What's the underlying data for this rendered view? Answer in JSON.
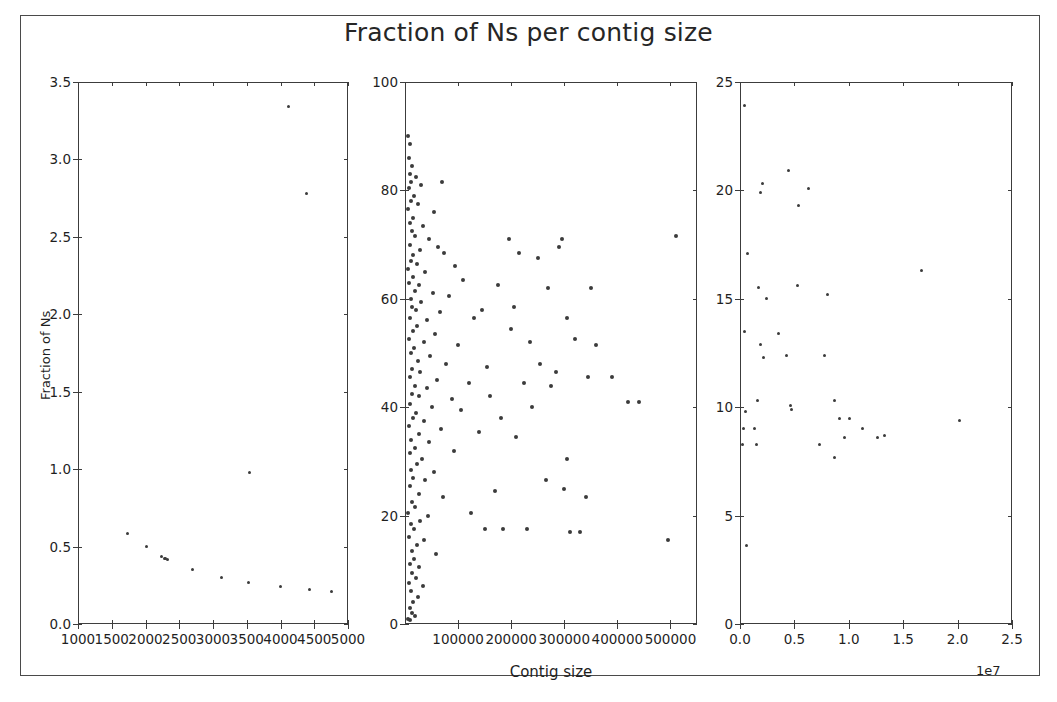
{
  "figure": {
    "title": "Fraction of Ns per contig size",
    "border_color": "#4a4a4a",
    "marker_color": "#3b3b3b",
    "background": "#ffffff",
    "width": 1057,
    "height": 702
  },
  "chart_data": [
    {
      "type": "scatter",
      "panel": "left",
      "title": "Fraction of Ns per contig size",
      "xlabel": "",
      "ylabel": "Fraction of Ns",
      "xlim": [
        1000,
        5000
      ],
      "ylim": [
        0.0,
        3.5
      ],
      "xticks": [
        1000,
        1500,
        2000,
        2500,
        3000,
        3500,
        4000,
        4500,
        5000
      ],
      "xticklabels": [
        "1000",
        "1500",
        "2000",
        "2500",
        "3000",
        "3500",
        "4000",
        "4500",
        "5000"
      ],
      "yticks": [
        0.0,
        0.5,
        1.0,
        1.5,
        2.0,
        2.5,
        3.0,
        3.5
      ],
      "yticklabels": [
        "0.0",
        "0.5",
        "1.0",
        "1.5",
        "2.0",
        "2.5",
        "3.0",
        "3.5"
      ],
      "grid": false,
      "legend": null,
      "points": [
        [
          4120,
          3.34
        ],
        [
          4380,
          2.78
        ],
        [
          3540,
          0.98
        ],
        [
          1730,
          0.585
        ],
        [
          2010,
          0.5
        ],
        [
          2230,
          0.435
        ],
        [
          2280,
          0.425
        ],
        [
          2300,
          0.42
        ],
        [
          2330,
          0.415
        ],
        [
          2700,
          0.355
        ],
        [
          3120,
          0.3
        ],
        [
          3530,
          0.265
        ],
        [
          4000,
          0.245
        ],
        [
          4430,
          0.225
        ],
        [
          4760,
          0.21
        ]
      ],
      "zero_band": {
        "description": "dense saturated band of points at Fraction of Ns = 0.0",
        "y": 0.0,
        "x_ranges": [
          [
            1000,
            3880
          ],
          [
            3960,
            4460
          ],
          [
            4540,
            4780
          ]
        ]
      }
    },
    {
      "type": "scatter",
      "panel": "middle",
      "title": "",
      "xlabel": "Contig size",
      "ylabel": "",
      "xlim": [
        0,
        550000
      ],
      "ylim": [
        0,
        100
      ],
      "xticks": [
        100000,
        200000,
        300000,
        400000,
        500000
      ],
      "xticklabels": [
        "100000",
        "200000",
        "300000",
        "400000",
        "500000"
      ],
      "yticks": [
        0,
        20,
        40,
        60,
        80,
        100
      ],
      "yticklabels": [
        "0",
        "20",
        "40",
        "60",
        "80",
        "100"
      ],
      "grid": false,
      "legend": null,
      "points": [
        [
          6000,
          90.0
        ],
        [
          9000,
          88.5
        ],
        [
          7000,
          86.0
        ],
        [
          14000,
          84.5
        ],
        [
          10000,
          83.0
        ],
        [
          21000,
          82.5
        ],
        [
          12000,
          81.5
        ],
        [
          8000,
          80.5
        ],
        [
          30000,
          81.0
        ],
        [
          70000,
          81.5
        ],
        [
          17000,
          79.0
        ],
        [
          11000,
          78.0
        ],
        [
          25000,
          77.5
        ],
        [
          5000,
          76.5
        ],
        [
          55000,
          76.0
        ],
        [
          15000,
          75.0
        ],
        [
          9500,
          74.0
        ],
        [
          33000,
          73.5
        ],
        [
          13000,
          72.5
        ],
        [
          19000,
          71.5
        ],
        [
          45000,
          71.0
        ],
        [
          8500,
          70.0
        ],
        [
          62000,
          69.5
        ],
        [
          28000,
          69.0
        ],
        [
          16000,
          68.0
        ],
        [
          74000,
          68.5
        ],
        [
          11500,
          67.0
        ],
        [
          22000,
          66.5
        ],
        [
          6500,
          65.5
        ],
        [
          95000,
          66.0
        ],
        [
          38000,
          65.0
        ],
        [
          14500,
          64.0
        ],
        [
          7500,
          63.0
        ],
        [
          26000,
          62.5
        ],
        [
          110000,
          63.5
        ],
        [
          18000,
          61.5
        ],
        [
          52000,
          61.0
        ],
        [
          10500,
          60.0
        ],
        [
          31000,
          59.5
        ],
        [
          83000,
          60.5
        ],
        [
          12500,
          58.5
        ],
        [
          20000,
          58.0
        ],
        [
          66000,
          57.5
        ],
        [
          9000,
          56.5
        ],
        [
          41000,
          56.0
        ],
        [
          23000,
          55.0
        ],
        [
          130000,
          56.5
        ],
        [
          15500,
          54.0
        ],
        [
          57000,
          53.5
        ],
        [
          8000,
          52.5
        ],
        [
          35000,
          52.0
        ],
        [
          17500,
          51.0
        ],
        [
          100000,
          51.5
        ],
        [
          11000,
          50.0
        ],
        [
          48000,
          49.5
        ],
        [
          24000,
          48.5
        ],
        [
          78000,
          48.0
        ],
        [
          13500,
          47.0
        ],
        [
          29000,
          46.5
        ],
        [
          155000,
          47.5
        ],
        [
          9500,
          45.5
        ],
        [
          60000,
          45.0
        ],
        [
          19500,
          44.0
        ],
        [
          42000,
          43.5
        ],
        [
          120000,
          44.5
        ],
        [
          14000,
          42.5
        ],
        [
          26500,
          42.0
        ],
        [
          88000,
          41.5
        ],
        [
          10000,
          40.5
        ],
        [
          50000,
          40.0
        ],
        [
          21500,
          39.0
        ],
        [
          105000,
          39.5
        ],
        [
          16000,
          38.0
        ],
        [
          36000,
          37.5
        ],
        [
          7000,
          36.5
        ],
        [
          68000,
          36.0
        ],
        [
          27000,
          35.0
        ],
        [
          140000,
          35.5
        ],
        [
          12000,
          34.0
        ],
        [
          45000,
          33.5
        ],
        [
          18500,
          32.5
        ],
        [
          8500,
          31.5
        ],
        [
          92000,
          32.0
        ],
        [
          31500,
          30.5
        ],
        [
          22500,
          29.5
        ],
        [
          11500,
          28.5
        ],
        [
          54000,
          28.0
        ],
        [
          15000,
          27.0
        ],
        [
          38500,
          26.5
        ],
        [
          170000,
          24.5
        ],
        [
          9000,
          25.5
        ],
        [
          25500,
          24.0
        ],
        [
          72000,
          23.5
        ],
        [
          13000,
          22.5
        ],
        [
          19000,
          21.5
        ],
        [
          6500,
          20.5
        ],
        [
          44000,
          20.0
        ],
        [
          29000,
          19.0
        ],
        [
          10500,
          18.5
        ],
        [
          16500,
          17.5
        ],
        [
          230000,
          17.5
        ],
        [
          310000,
          17.0
        ],
        [
          330000,
          17.0
        ],
        [
          8000,
          16.0
        ],
        [
          35000,
          15.5
        ],
        [
          22000,
          14.5
        ],
        [
          12500,
          13.5
        ],
        [
          58000,
          13.0
        ],
        [
          17000,
          12.0
        ],
        [
          9500,
          11.0
        ],
        [
          27000,
          10.5
        ],
        [
          14000,
          9.5
        ],
        [
          20000,
          8.5
        ],
        [
          7500,
          7.5
        ],
        [
          33000,
          7.0
        ],
        [
          11000,
          6.0
        ],
        [
          24000,
          5.0
        ],
        [
          16000,
          4.0
        ],
        [
          9000,
          3.0
        ],
        [
          13500,
          2.0
        ],
        [
          6000,
          1.0
        ],
        [
          19000,
          1.5
        ],
        [
          8500,
          0.8
        ],
        [
          195000,
          71.0
        ],
        [
          215000,
          68.5
        ],
        [
          250000,
          67.5
        ],
        [
          290000,
          69.5
        ],
        [
          270000,
          62.0
        ],
        [
          305000,
          56.5
        ],
        [
          350000,
          62.0
        ],
        [
          320000,
          52.5
        ],
        [
          360000,
          51.5
        ],
        [
          255000,
          48.0
        ],
        [
          285000,
          46.5
        ],
        [
          420000,
          41.0
        ],
        [
          440000,
          41.0
        ],
        [
          390000,
          45.5
        ],
        [
          225000,
          44.5
        ],
        [
          305000,
          30.5
        ],
        [
          210000,
          34.5
        ],
        [
          180000,
          38.0
        ],
        [
          160000,
          42.0
        ],
        [
          145000,
          58.0
        ],
        [
          175000,
          62.5
        ],
        [
          200000,
          54.5
        ],
        [
          240000,
          40.0
        ],
        [
          265000,
          26.5
        ],
        [
          300000,
          25.0
        ],
        [
          340000,
          23.5
        ],
        [
          510000,
          71.5
        ],
        [
          495000,
          15.5
        ],
        [
          150000,
          17.5
        ],
        [
          185000,
          17.5
        ],
        [
          125000,
          20.5
        ],
        [
          205000,
          58.5
        ],
        [
          235000,
          52.0
        ],
        [
          275000,
          44.0
        ],
        [
          295000,
          71.0
        ],
        [
          345000,
          45.5
        ]
      ]
    },
    {
      "type": "scatter",
      "panel": "right",
      "title": "",
      "xlabel": "",
      "ylabel": "",
      "x_exponent_label": "1e7",
      "xlim": [
        0,
        25000000
      ],
      "ylim": [
        0,
        25
      ],
      "xticks": [
        0.0,
        0.5,
        1.0,
        1.5,
        2.0,
        2.5
      ],
      "xticklabels": [
        "0.0",
        "0.5",
        "1.0",
        "1.5",
        "2.0",
        "2.5"
      ],
      "yticks": [
        0,
        5,
        10,
        15,
        20,
        25
      ],
      "yticklabels": [
        "0",
        "5",
        "10",
        "15",
        "20",
        "25"
      ],
      "grid": false,
      "legend": null,
      "points": [
        [
          400000,
          23.9
        ],
        [
          4500000,
          20.9
        ],
        [
          2100000,
          20.3
        ],
        [
          1900000,
          19.9
        ],
        [
          6300000,
          20.1
        ],
        [
          5400000,
          19.3
        ],
        [
          700000,
          17.1
        ],
        [
          1700000,
          15.5
        ],
        [
          2400000,
          15.0
        ],
        [
          5300000,
          15.6
        ],
        [
          8000000,
          15.2
        ],
        [
          16700000,
          16.3
        ],
        [
          400000,
          13.5
        ],
        [
          3500000,
          13.4
        ],
        [
          1900000,
          12.9
        ],
        [
          4300000,
          12.4
        ],
        [
          2200000,
          12.3
        ],
        [
          7800000,
          12.4
        ],
        [
          1600000,
          10.3
        ],
        [
          4600000,
          10.1
        ],
        [
          4700000,
          9.9
        ],
        [
          8700000,
          10.3
        ],
        [
          500000,
          9.8
        ],
        [
          9100000,
          9.5
        ],
        [
          20200000,
          9.4
        ],
        [
          300000,
          9.0
        ],
        [
          1300000,
          9.0
        ],
        [
          10100000,
          9.5
        ],
        [
          11300000,
          9.0
        ],
        [
          7300000,
          8.3
        ],
        [
          12600000,
          8.6
        ],
        [
          13300000,
          8.7
        ],
        [
          200000,
          8.3
        ],
        [
          1500000,
          8.3
        ],
        [
          9600000,
          8.6
        ],
        [
          8700000,
          7.7
        ],
        [
          600000,
          3.6
        ]
      ]
    }
  ],
  "panels": {
    "left": {
      "ylabel": "Fraction of Ns",
      "xticklabels": [
        "1000",
        "1500",
        "2000",
        "2500",
        "3000",
        "3500",
        "4000",
        "4500",
        "5000"
      ],
      "yticklabels": [
        "0.0",
        "0.5",
        "1.0",
        "1.5",
        "2.0",
        "2.5",
        "3.0",
        "3.5"
      ]
    },
    "middle": {
      "xlabel": "Contig size",
      "xticklabels": [
        "100000",
        "200000",
        "300000",
        "400000",
        "500000"
      ],
      "yticklabels": [
        "0",
        "20",
        "40",
        "60",
        "80",
        "100"
      ]
    },
    "right": {
      "exponent": "1e7",
      "xticklabels": [
        "0.0",
        "0.5",
        "1.0",
        "1.5",
        "2.0",
        "2.5"
      ],
      "yticklabels": [
        "0",
        "5",
        "10",
        "15",
        "20",
        "25"
      ]
    }
  }
}
